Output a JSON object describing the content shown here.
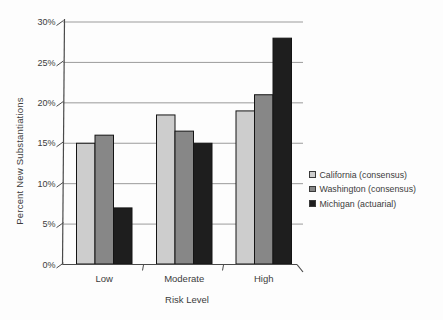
{
  "chart_data": {
    "type": "bar",
    "title": "",
    "xlabel": "Risk Level",
    "ylabel": "Percent New Substantiations",
    "categories": [
      "Low",
      "Moderate",
      "High"
    ],
    "series": [
      {
        "name": "California (consensus)",
        "color": "#cdcdcd",
        "values": [
          15,
          18.5,
          19
        ]
      },
      {
        "name": "Washington (consensus)",
        "color": "#878787",
        "values": [
          16,
          16.5,
          21
        ]
      },
      {
        "name": "Michigan (actuarial)",
        "color": "#1e1e1e",
        "values": [
          7,
          15,
          28
        ]
      }
    ],
    "ylim": [
      0,
      30
    ],
    "ytick_step": 5,
    "ytick_labels": [
      "0%",
      "5%",
      "10%",
      "15%",
      "20%",
      "25%",
      "30%"
    ],
    "grid": true,
    "legend_position": "middle-right",
    "bar_outline_color": "#141414",
    "axis_color": "#4a4a4a",
    "gridline_color": "#909090"
  }
}
